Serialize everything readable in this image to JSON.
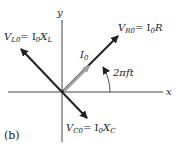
{
  "figure": {
    "panel_label": "(b)",
    "axes": {
      "x_label": "x",
      "y_label": "y"
    },
    "phasors": [
      {
        "id": "VL0",
        "label_main": "V",
        "label_sub": "L0",
        "eq": "= I",
        "eq_sub": "0",
        "eq_tail": "X",
        "eq_tail_sub": "L"
      },
      {
        "id": "VR0",
        "label_main": "V",
        "label_sub": "R0",
        "eq": "= I",
        "eq_sub": "0",
        "eq_tail": "R",
        "eq_tail_sub": ""
      },
      {
        "id": "VC0",
        "label_main": "V",
        "label_sub": "C0",
        "eq": "= I",
        "eq_sub": "0",
        "eq_tail": "X",
        "eq_tail_sub": "C"
      },
      {
        "id": "I0",
        "label_main": "I",
        "label_sub": "0"
      }
    ],
    "angle_label": "2πft",
    "colors": {
      "arrow": "#222222",
      "current_arrow": "#a0a0a0",
      "axis": "#444444"
    }
  }
}
